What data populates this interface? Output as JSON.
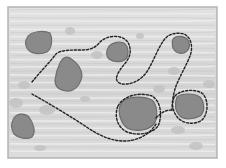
{
  "canvas": {
    "width": 226,
    "height": 168,
    "background": "#ffffff"
  },
  "frame": {
    "x": 8,
    "y": 7,
    "width": 209,
    "height": 151,
    "fill": "#dadada",
    "border_color": "#b4b4b4",
    "texture_color": "#eeeeee",
    "texture_dark": "#c4c4c4"
  },
  "colors": {
    "blob_fill": "#8a8a8a",
    "blob_edge": "#6e6e6e",
    "spot_fill": "#c2c2c2",
    "dash_color": "#222222"
  },
  "blobs": [
    {
      "id": "blob-top-left",
      "path": "M27,38 C30,31 44,30 50,33 C53,39 52,48 47,52 C40,55 30,54 27,48 C25,44 25,41 27,38 Z"
    },
    {
      "id": "blob-center-left",
      "path": "M60,63 C62,58 66,56 70,58 C76,62 82,68 82,76 C80,86 74,92 66,91 C58,90 55,86 55,80 C56,72 58,67 60,63 Z"
    },
    {
      "id": "blob-center-top",
      "path": "M108,48 C110,43 118,41 124,43 C129,47 129,55 126,59 C121,63 113,62 109,59 C106,56 106,51 108,48 Z"
    },
    {
      "id": "blob-right-top",
      "path": "M174,38 C177,35 185,36 188,40 C191,45 189,51 184,53 C179,54 175,52 173,48 C172,44 172,40 174,38 Z"
    },
    {
      "id": "blob-bottom-center",
      "path": "M123,101 C130,96 145,96 152,100 C158,106 158,118 154,124 C148,131 134,132 127,128 C120,122 118,112 120,106 Z"
    },
    {
      "id": "blob-bottom-right",
      "path": "M177,97 C182,93 194,93 200,97 C205,103 205,112 200,116 C194,119 186,120 181,117 C175,112 174,104 177,97 Z"
    },
    {
      "id": "blob-bottom-left",
      "path": "M14,118 C17,113 25,113 29,117 C34,124 36,132 32,137 C27,140 18,138 14,134 C11,129 11,123 14,118 Z"
    }
  ],
  "spots": [
    {
      "cx": 70,
      "cy": 31,
      "rx": 5,
      "ry": 4
    },
    {
      "cx": 24,
      "cy": 85,
      "rx": 6,
      "ry": 4
    },
    {
      "cx": 16,
      "cy": 103,
      "rx": 7,
      "ry": 5
    },
    {
      "cx": 47,
      "cy": 110,
      "rx": 8,
      "ry": 5
    },
    {
      "cx": 97,
      "cy": 55,
      "rx": 6,
      "ry": 4
    },
    {
      "cx": 85,
      "cy": 99,
      "rx": 5,
      "ry": 3
    },
    {
      "cx": 159,
      "cy": 89,
      "rx": 6,
      "ry": 4
    },
    {
      "cx": 174,
      "cy": 71,
      "rx": 6,
      "ry": 4
    },
    {
      "cx": 209,
      "cy": 84,
      "rx": 6,
      "ry": 4
    },
    {
      "cx": 178,
      "cy": 130,
      "rx": 7,
      "ry": 4
    },
    {
      "cx": 196,
      "cy": 146,
      "rx": 7,
      "ry": 4
    },
    {
      "cx": 140,
      "cy": 36,
      "rx": 4,
      "ry": 3
    },
    {
      "cx": 40,
      "cy": 148,
      "rx": 6,
      "ry": 3
    }
  ],
  "dashed_paths": [
    {
      "id": "route-outer",
      "d": "M32,82 C40,72 50,62 56,54 C60,50 70,50 82,50 C92,50 97,46 100,42 C104,38 112,35 120,37 C128,39 131,46 130,54 C128,62 122,66 120,70 C116,76 114,82 122,84 C132,85 142,80 148,70 C154,60 158,48 164,40 C168,34 176,32 184,34 C192,38 193,48 190,56 C186,66 180,76 176,86 C173,94 172,104 172,110"
    },
    {
      "id": "route-lower",
      "d": "M32,94 C50,104 70,116 88,128 C100,136 112,141 124,141 C138,141 150,134 156,124"
    },
    {
      "id": "ring-bottom-center",
      "d": "M118,106 C124,95 140,92 152,96 C162,102 162,118 158,126 C152,134 138,136 127,132 C117,127 114,116 118,106 Z"
    },
    {
      "id": "ring-bottom-right",
      "d": "M175,96 C180,90 196,88 203,94 C209,101 208,114 202,120 C195,125 184,124 178,118 C172,111 171,102 175,96 Z"
    },
    {
      "id": "connector-right",
      "d": "M156,118 C162,112 166,110 172,110"
    }
  ],
  "dash": {
    "width": 1.4,
    "pattern": "2.2 1.8"
  }
}
